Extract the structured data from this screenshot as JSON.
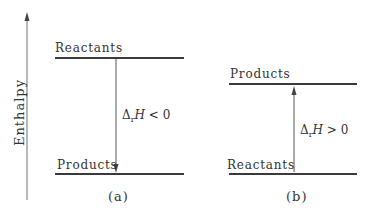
{
  "diagram": {
    "y_axis": {
      "label": "Enthalpy"
    },
    "panel_a": {
      "caption": "(a)",
      "upper_level": "Reactants",
      "lower_level": "Products",
      "delta_symbol": "Δ",
      "delta_sub": "r",
      "delta_var": "H",
      "delta_relation": " < 0",
      "arrow_direction": "down"
    },
    "panel_b": {
      "caption": "(b)",
      "upper_level": "Products",
      "lower_level": "Reactants",
      "delta_symbol": "Δ",
      "delta_sub": "r",
      "delta_var": "H",
      "delta_relation": " > 0",
      "arrow_direction": "up"
    }
  }
}
